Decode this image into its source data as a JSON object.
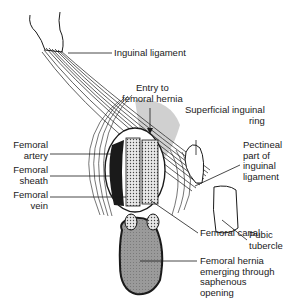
{
  "diagram": {
    "colors": {
      "line": "#1a1a1a",
      "hernia_fill": "#9a9a9a",
      "entry_shade": "#cfcfcf",
      "background": "#ffffff"
    },
    "labels": {
      "inguinal_ligament": "Inguinal ligament",
      "entry_to_femoral_hernia": "Entry to\nfemoral hernia",
      "superficial_inguinal_ring": "Superficial inguinal\nring",
      "pectineal_part": "Pectineal\npart of\ninguinal\nligament",
      "femoral_artery": "Femoral\nartery",
      "femoral_sheath": "Femoral\nsheath",
      "femoral_vein": "Femoral\nvein",
      "pubic_tubercle": "Pubic\ntubercle",
      "femoral_canal": "Femoral canal",
      "femoral_hernia": "Femoral hernia\nemerging through\nsaphenous\nopening"
    }
  }
}
